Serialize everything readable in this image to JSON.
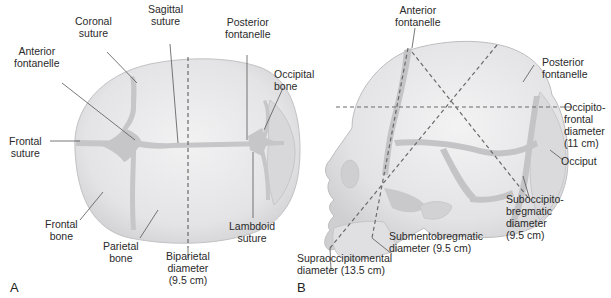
{
  "panel_a": {
    "letter": "A",
    "labels": {
      "sagittal_suture": [
        "Sagittal",
        "suture"
      ],
      "coronal_suture": [
        "Coronal",
        "suture"
      ],
      "posterior_fontanelle": [
        "Posterior",
        "fontanelle"
      ],
      "anterior_fontanelle": [
        "Anterior",
        "fontanelle"
      ],
      "occipital_bone": [
        "Occipital",
        "bone"
      ],
      "frontal_suture": [
        "Frontal",
        "suture"
      ],
      "frontal_bone": [
        "Frontal",
        "bone"
      ],
      "parietal_bone": [
        "Parietal",
        "bone"
      ],
      "biparietal_diameter": [
        "Biparietal",
        "diameter",
        "(9.5 cm)"
      ],
      "lambdoid_suture": [
        "Lambdoid",
        "suture"
      ]
    }
  },
  "panel_b": {
    "letter": "B",
    "labels": {
      "anterior_fontanelle": [
        "Anterior",
        "fontanelle"
      ],
      "posterior_fontanelle": [
        "Posterior",
        "fontanelle"
      ],
      "occipitofrontal_diameter": [
        "Occipito-",
        "frontal",
        "diameter",
        "(11 cm)"
      ],
      "occiput": [
        "Occiput"
      ],
      "suboccipitobregmatic_diameter": [
        "Suboccipito-",
        "bregmatic",
        "diameter",
        "(9.5 cm)"
      ],
      "submentobregmatic_diameter": [
        "Submentobregmatic",
        "diameter (9.5 cm)"
      ],
      "supraoccipitomental_diameter": [
        "Supraoccipitomental",
        "diameter (13.5 cm)"
      ]
    }
  },
  "colors": {
    "bone_fill": "#e6e6e8",
    "bone_shade": "#d6d6d8",
    "suture_fill": "#c4c4c6",
    "outline": "#b0b0b2",
    "dash": "#6a6a6a",
    "leader": "#444444"
  }
}
